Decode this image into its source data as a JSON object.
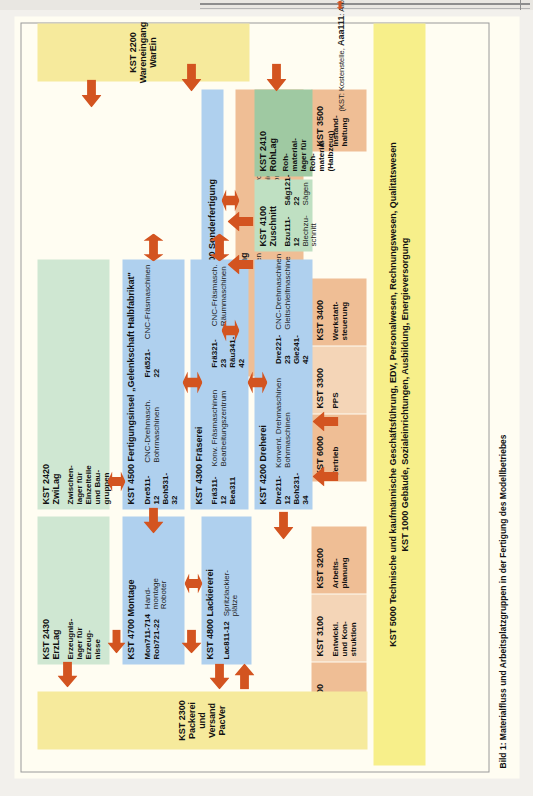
{
  "figure": {
    "caption": "Bild 1:  Materialfluss und Arbeitsplatzgruppen in der Fertigung des Modellbetriebes",
    "legend_note_1": "(KST: Kostenstelle,",
    "legend_note_2": "Aaa111",
    "legend_note_3": ": Arbeitsplatz-Nr.)",
    "legend_flow": "Materialfluss"
  },
  "bands": {
    "admin_line1": "KST 5000 Technische und kaufmännische Geschäftsführung, EDV, Personalwesen, Rechnungswesen, Qualitätswesen",
    "admin_line2": "KST 1000 Gebäude, Sozialeinrichtungen, Ausbildung, Energieversorgung",
    "wareneingang_line1": "KST 2200 Wareneingang",
    "wareneingang_line2": "WarEin",
    "packerei_line1": "KST 2300 Packerei und Versand",
    "packerei_line2": "PacVer"
  },
  "admin_boxes": [
    {
      "title": "KST 2100",
      "sub": "Einkauf"
    },
    {
      "title": "KST 3100",
      "sub": "Entwickl.\nund Kon-\nstruktion"
    },
    {
      "title": "KST 3200",
      "sub": "Arbeits-\nplanung"
    },
    {
      "title": "KST 6000",
      "sub": "Vertrieb"
    },
    {
      "title": "KST 3300",
      "sub": "PPS"
    },
    {
      "title": "KST 3400",
      "sub": "Werkstatt-\nsteuerung"
    },
    {
      "title": "KST 3500",
      "sub": "Instand-\nhaltung"
    }
  ],
  "stores": [
    {
      "title": "KST 2430\nErzLag",
      "sub": "Erzeugnis-\nlager für\nErzeug-\nnisse"
    },
    {
      "title": "KST 2420\nZwiLag",
      "sub": "Zwischen-\nlager für\nEinzelteile\nund Bau-\ngruppen"
    },
    {
      "title": "KST 2410\nRohLag",
      "sub": "Roh-\nmaterial-\nlager für\nRoh-\nmaterial\n(Halbzeug)"
    }
  ],
  "cells": [
    {
      "id": "montage",
      "title": "KST 4700 Montage",
      "codes": [
        "Mon711-714",
        "Rob721-22"
      ],
      "machines": [
        "Hand-\nmontage",
        "Roboter"
      ]
    },
    {
      "id": "lackiererei",
      "title": "KST 4800 Lackiererei",
      "codes": [
        "Lac811-12"
      ],
      "machines": [
        "Spritzlackier-\nplätze"
      ]
    },
    {
      "id": "blechbearbeitung",
      "title": "KST 4600 Blechbearbeitung",
      "codes_a": [
        "Pre611-12",
        "Pre631-32",
        "Boh651-53",
        "Sch671-72"
      ],
      "machines_a": [
        "Handspindelpressen",
        "Exzenterpressen",
        "Bohrmaschinen",
        "Schweißplätze"
      ],
      "codes_b": [
        "Pre621-22",
        "Pre641-42",
        "Mon661-62"
      ],
      "machines_b": [
        "Hydraulikpressen",
        "Kniehebelpressen",
        "Montageplätze"
      ]
    },
    {
      "id": "sonderfertigung",
      "title": "KST 4400 Sonderfertigung"
    },
    {
      "id": "fertigungsinsel",
      "title": "KST 4500 Fertigungsinsel „Gelenkschaft Halbfabrikat\"",
      "codes_a": [
        "Dre511-12",
        "Boh531-32"
      ],
      "machines_a": [
        "CNC-Drehmasch.",
        "Bohrmaschinen"
      ],
      "codes_b": [
        "Frä521-22"
      ],
      "machines_b": [
        "CNC-Fräsmaschinen"
      ]
    },
    {
      "id": "fraeserei",
      "title": "KST 4300 Fräserei",
      "codes_a": [
        "Frä311-12",
        "Bea311"
      ],
      "machines_a": [
        "Konv. Fräsmaschinen",
        "Bearbeitungszentrum"
      ],
      "codes_b": [
        "Frä321-23",
        "Räu341-42"
      ],
      "machines_b": [
        "CNC-Fräsmasch.",
        "Räummaschinen"
      ]
    },
    {
      "id": "dreherei",
      "title": "KST 4200 Dreherei",
      "codes_a": [
        "Dre211-12",
        "Boh231-34"
      ],
      "machines_a": [
        "Konvent. Drehmaschinen",
        "Bohrmaschinen"
      ],
      "codes_b": [
        "Dre221-23",
        "Gle241-42"
      ],
      "machines_b": [
        "CNC-Drehmaschinen",
        "Gleitschleifmaschine"
      ]
    },
    {
      "id": "zuschnitt",
      "title": "KST 4100\nZuschnitt",
      "codes_a": [
        "Bzu111-12"
      ],
      "machines_a": [
        "Blechzu-\nschnitt"
      ],
      "codes_b": [
        "Säg121-22"
      ],
      "machines_b": [
        "Sägen"
      ]
    }
  ],
  "colors": {
    "yellow": "#f7ef8a",
    "orange": "#efbe95",
    "blue": "#afd0ee",
    "green": "#bfe0c2",
    "arrow": "#d35420"
  }
}
